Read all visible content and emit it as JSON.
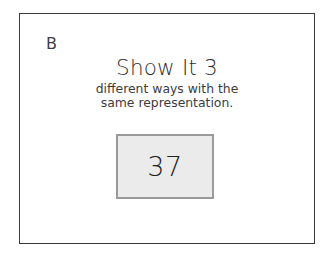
{
  "slide": {
    "panel_label": "B",
    "headline": "Show It 3",
    "subline_1": "different ways with the",
    "subline_2": "same representation.",
    "value_card": {
      "number": "37"
    },
    "colors": {
      "background": "#ffffff",
      "frame_border": "#3a3a3a",
      "headline_text": "#2e2e2e",
      "body_text": "#3c3c3c",
      "card_fill": "#ebebeb",
      "card_border": "#9a9a9a",
      "number_text": "#1f1f1f"
    }
  }
}
